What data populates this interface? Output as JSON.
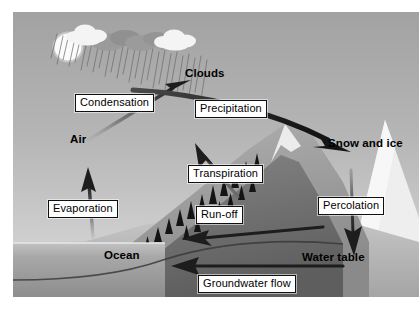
{
  "diagram": {
    "type": "process-diagram",
    "canvas": {
      "width": 419,
      "height": 310
    },
    "palette": {
      "sky_top": "#a9a9a9",
      "sky_bottom": "#d8d8d8",
      "sun": "#fdfdfd",
      "ocean": "#9a9a9a",
      "land": "#bfbfbf",
      "mountain_dark": "#6f6f6f",
      "mountain_light": "#9d9d9d",
      "snow": "#f2f2f2",
      "arrow": "#1d1d1d",
      "label_bg": "#ffffff",
      "label_border": "#101010",
      "label_text": "#000000",
      "trees": "#1a1a1a",
      "rain": "#6a6a6a"
    },
    "boxed_labels": [
      {
        "id": "condensation",
        "text": "Condensation",
        "x": 75,
        "y": 94
      },
      {
        "id": "precipitation",
        "text": "Precipitation",
        "x": 195,
        "y": 100
      },
      {
        "id": "transpiration",
        "text": "Transpiration",
        "x": 188,
        "y": 165
      },
      {
        "id": "evaporation",
        "text": "Evaporation",
        "x": 48,
        "y": 200
      },
      {
        "id": "runoff",
        "text": "Run-off",
        "x": 196,
        "y": 206
      },
      {
        "id": "percolation",
        "text": "Percolation",
        "x": 318,
        "y": 197
      },
      {
        "id": "groundwater-flow",
        "text": "Groundwater flow",
        "x": 198,
        "y": 275
      }
    ],
    "plain_labels": [
      {
        "id": "clouds",
        "text": "Clouds",
        "x": 185,
        "y": 69
      },
      {
        "id": "air",
        "text": "Air",
        "x": 70,
        "y": 134
      },
      {
        "id": "snow-and-ice",
        "text": "Snow and ice",
        "x": 328,
        "y": 138
      },
      {
        "id": "ocean",
        "text": "Ocean",
        "x": 104,
        "y": 250
      },
      {
        "id": "water-table",
        "text": "Water table",
        "x": 302,
        "y": 252
      }
    ],
    "elements": {
      "sun": "sun-icon",
      "clouds": "cloud-icon",
      "rain": "rain-streaks-icon",
      "mountain": "mountain-icon",
      "trees": "conifer-trees-icon",
      "ocean": "ocean-water-icon",
      "arrows": [
        "condensation-arrow",
        "precipitation-arrow",
        "transpiration-arrow",
        "evaporation-arrow",
        "runoff-arrow",
        "percolation-arrow",
        "groundwater-flow-arrow"
      ]
    }
  }
}
